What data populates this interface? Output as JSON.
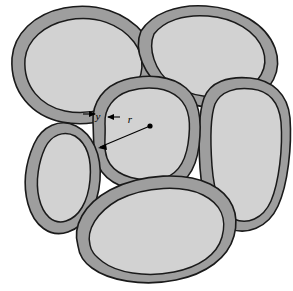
{
  "figure": {
    "background_color": "#ffffff",
    "width": 293,
    "height": 291,
    "shell_color": "#9e9e9e",
    "core_color": "#d2d2d2",
    "outline_color": "#1a1a1a",
    "annotation_color": "#000000"
  },
  "labels": {
    "shell_thickness": "y",
    "core_radius": "r"
  },
  "annotations": [
    {
      "name": "shell-thickness-dimension",
      "symbol": "y",
      "description": "Inward-pointing arrows spanning the gray shell layer thickness of the central grain",
      "label_x": 101,
      "label_y": 116
    },
    {
      "name": "core-radius-leader",
      "symbol": "r",
      "description": "Arrow from the center dot of the central grain to its inner core boundary",
      "label_x": 130,
      "label_y": 120,
      "center_x": 150,
      "center_y": 126,
      "tip_x": 99,
      "tip_y": 148
    }
  ],
  "grains": [
    {
      "name": "grain-top-left",
      "shell_path": "M 12,58 C 14,34 34,14 64,8 C 96,2 126,12 144,34 C 160,54 158,80 142,98 C 124,118 92,128 62,122 C 32,116 10,92 12,58 Z",
      "core_path": "M 25,59 C 27,40 44,25 68,20 C 96,15 120,24 134,42 C 146,58 144,78 131,92 C 116,108 90,116 65,111 C 41,106 23,87 25,59 Z"
    },
    {
      "name": "grain-top-right",
      "shell_path": "M 141,31 C 152,14 176,4 206,6 C 238,8 266,24 275,48 C 283,70 272,92 248,102 C 222,113 188,108 166,92 C 144,76 133,50 141,31 Z",
      "core_path": "M 154,34 C 164,21 184,14 208,16 C 234,18 256,31 263,50 C 269,67 260,84 240,92 C 218,101 190,97 172,84 C 154,71 148,48 154,34 Z"
    },
    {
      "name": "grain-right",
      "shell_path": "M 204,98 C 210,82 228,76 250,78 C 272,80 288,94 290,118 C 292,146 288,184 278,206 C 268,228 246,236 228,228 C 210,220 202,198 200,168 C 198,136 199,112 204,98 Z",
      "core_path": "M 215,104 C 221,91 236,87 252,89 C 270,91 279,103 281,122 C 283,148 279,182 271,201 C 263,219 247,225 234,219 C 220,212 214,193 212,166 C 210,138 211,115 215,104 Z"
    },
    {
      "name": "grain-center",
      "shell_path": "M 93,122 C 92,102 104,86 124,80 C 148,73 172,76 186,88 C 200,100 202,122 199,146 C 196,170 186,186 164,190 C 140,194 114,188 102,172 C 92,158 94,140 93,122 Z",
      "core_path": "M 105,124 C 104,108 114,96 129,91 C 149,85 168,88 179,98 C 190,108 191,124 188,144 C 185,163 177,176 160,179 C 140,182 119,177 110,164 C 102,152 106,138 105,124 Z"
    },
    {
      "name": "grain-left-small",
      "shell_path": "M 34,144 C 42,126 60,118 76,126 C 92,134 102,154 100,180 C 98,206 86,226 68,232 C 50,238 34,226 28,204 C 22,182 26,162 34,144 Z",
      "core_path": "M 45,148 C 51,135 64,130 75,136 C 86,143 92,158 90,180 C 88,202 79,217 66,221 C 53,225 43,215 39,198 C 35,181 39,161 45,148 Z"
    },
    {
      "name": "grain-bottom",
      "shell_path": "M 78,246 C 72,226 84,204 110,190 C 142,173 186,172 210,184 C 232,195 240,214 234,236 C 228,258 206,274 176,280 C 142,287 108,280 92,268 C 82,261 79,254 78,246 Z",
      "core_path": "M 90,245 C 86,230 97,212 118,200 C 146,186 183,185 203,195 C 221,204 227,219 222,237 C 217,255 199,267 174,272 C 145,278 116,272 103,262 C 94,255 91,251 90,245 Z"
    }
  ]
}
